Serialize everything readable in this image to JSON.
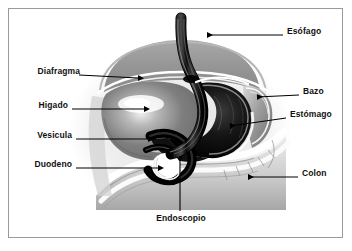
{
  "figure": {
    "language": "es",
    "frame_color": "#9a9a9a",
    "background_color": "#ffffff",
    "label_color": "#101010",
    "arrow_color": "#000000"
  },
  "labels": {
    "esofago": "Esófago",
    "diafragma": "Diafragma",
    "bazo": "Bazo",
    "higado": "Higado",
    "estomago": "Estómago",
    "vesicula": "Vesicula",
    "duodeno": "Duodeno",
    "colon": "Colon",
    "endoscopio": "Endoscopio"
  },
  "callouts": [
    {
      "key": "esofago",
      "text": "Esófago",
      "side": "right",
      "label_x": 287,
      "label_y": 31,
      "arrow": {
        "x1": 283,
        "y1": 35,
        "x2": 205,
        "y2": 35,
        "head": "left"
      }
    },
    {
      "key": "diafragma",
      "text": "Diafragma",
      "side": "left",
      "label_x": 25,
      "label_y": 71,
      "arrow": {
        "x1": 79,
        "y1": 75,
        "x2": 140,
        "y2": 78,
        "head": "right"
      }
    },
    {
      "key": "bazo",
      "text": "Bazo",
      "side": "right",
      "label_x": 303,
      "label_y": 91,
      "arrow": {
        "x1": 299,
        "y1": 95,
        "x2": 255,
        "y2": 97,
        "head": "left"
      }
    },
    {
      "key": "higado",
      "text": "Higado",
      "side": "left",
      "label_x": 35,
      "label_y": 105,
      "arrow": {
        "x1": 72,
        "y1": 109,
        "x2": 146,
        "y2": 109,
        "head": "right"
      }
    },
    {
      "key": "estomago",
      "text": "Estómago",
      "side": "right",
      "label_x": 290,
      "label_y": 114,
      "arrow": {
        "x1": 286,
        "y1": 118,
        "x2": 228,
        "y2": 126,
        "head": "left"
      }
    },
    {
      "key": "vesicula",
      "text": "Vesicula",
      "side": "left",
      "label_x": 32,
      "label_y": 135,
      "arrow": {
        "x1": 76,
        "y1": 139,
        "x2": 150,
        "y2": 139,
        "head": "right"
      }
    },
    {
      "key": "duodeno",
      "text": "Duodeno",
      "side": "left",
      "label_x": 31,
      "label_y": 164,
      "arrow": {
        "x1": 76,
        "y1": 168,
        "x2": 160,
        "y2": 168,
        "head": "right"
      }
    },
    {
      "key": "colon",
      "text": "Colon",
      "side": "right",
      "label_x": 302,
      "label_y": 173,
      "arrow": {
        "x1": 298,
        "y1": 177,
        "x2": 246,
        "y2": 177,
        "head": "left"
      }
    },
    {
      "key": "endoscopio",
      "text": "Endoscopio",
      "side": "bottom",
      "label_x": 152,
      "label_y": 218,
      "arrow": {
        "x1": 180,
        "y1": 213,
        "x2": 180,
        "y2": 158,
        "head": "none"
      }
    }
  ],
  "anatomy": {
    "organs": [
      {
        "name": "esophagus_with_endoscope",
        "tone": "black"
      },
      {
        "name": "diaphragm",
        "tone": "light-gray"
      },
      {
        "name": "liver",
        "tone": "mid-gray"
      },
      {
        "name": "spleen",
        "tone": "gray"
      },
      {
        "name": "stomach",
        "tone": "black"
      },
      {
        "name": "gallbladder",
        "tone": "white"
      },
      {
        "name": "duodenum",
        "tone": "black"
      },
      {
        "name": "colon",
        "tone": "white-gray"
      }
    ]
  }
}
